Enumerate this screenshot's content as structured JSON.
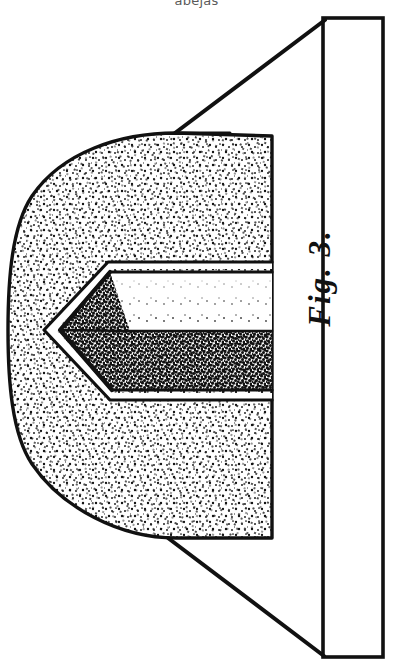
{
  "page": {
    "background_color": "#ffffff",
    "width": 393,
    "height": 670,
    "running_head": "abejas"
  },
  "figure": {
    "label": "Fig. 3.",
    "label_rotation_degrees": -90,
    "ink_color": "#111111",
    "paper_color": "#ffffff",
    "style": "stipple engraving",
    "parts": [
      {
        "name": "stippled-body",
        "shading": "light stipple",
        "outline_color": "#111111"
      },
      {
        "name": "chevron-groove",
        "shading": "dark stipple lower facet, blank upper facet",
        "outline_color": "#111111"
      },
      {
        "name": "vertical-bar",
        "shading": "blank",
        "outline_color": "#111111"
      },
      {
        "name": "upper-perspective-line",
        "shading": "none",
        "outline_color": "#111111"
      },
      {
        "name": "lower-perspective-line",
        "shading": "none",
        "outline_color": "#111111"
      }
    ]
  }
}
